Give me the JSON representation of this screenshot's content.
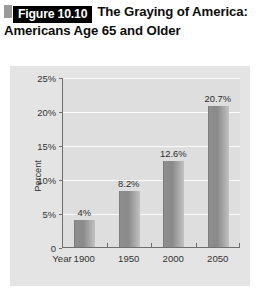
{
  "figure": {
    "badge_label": "Figure 10.10",
    "title": "The Graying of America: Americans Age 65 and Older"
  },
  "chart_data": {
    "type": "bar",
    "title": "The Graying of America: Americans Age 65 and Older",
    "categories": [
      "1900",
      "1950",
      "2000",
      "2050"
    ],
    "values": [
      4,
      8.2,
      12.6,
      20.7
    ],
    "value_labels": [
      "4%",
      "8.2%",
      "12.6%",
      "20.7%"
    ],
    "xlabel": "Year",
    "ylabel": "Percent",
    "ylim": [
      0,
      25
    ],
    "yticks": [
      0,
      5,
      10,
      15,
      20,
      25
    ],
    "ytick_labels": [
      "0",
      "5%",
      "10%",
      "15%",
      "20%",
      "25%"
    ],
    "grid": "horizontal",
    "legend": "none",
    "colors": {
      "bar_dark": "#8a8a8a",
      "bar_light": "#c2c2c2",
      "plot_background": "#dedede",
      "panel_background": "#e4e4e4",
      "gridline": "#fbfbfb",
      "axis": "#6f6f6f",
      "badge_background": "#000000",
      "badge_text": "#ffffff"
    }
  }
}
